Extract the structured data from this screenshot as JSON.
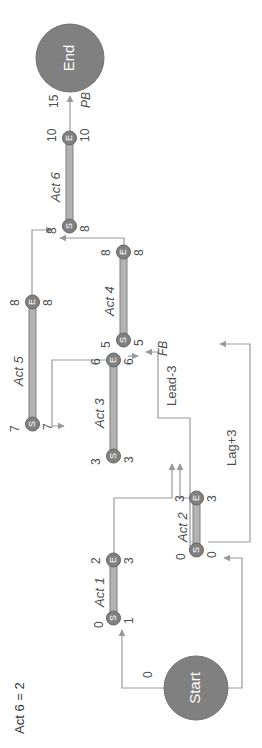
{
  "diagram": {
    "title_note": "Act 6 = 2",
    "rotation_deg": -90,
    "colors": {
      "node_fill": "#808080",
      "bar_fill": "#b3b3b3",
      "link": "#999999",
      "text": "#4d4d4d",
      "background": "#ffffff"
    },
    "terminals": {
      "start": {
        "label": "Start",
        "value": "0"
      },
      "end": {
        "label": "End",
        "value": "15"
      }
    },
    "activities": [
      {
        "id": "act1",
        "label": "Act 1",
        "start_marker": "S",
        "end_marker": "E",
        "start_top": "0",
        "start_bottom": "1",
        "end_top": "2",
        "end_bottom": "3"
      },
      {
        "id": "act2",
        "label": "Act 2",
        "start_marker": "S",
        "end_marker": "E",
        "start_top": "0",
        "start_bottom": "0",
        "end_top": "3",
        "end_bottom": "3"
      },
      {
        "id": "act3",
        "label": "Act 3",
        "start_marker": "S",
        "end_marker": "E",
        "start_top": "3",
        "start_bottom": "3",
        "end_top": "6",
        "end_bottom": "6"
      },
      {
        "id": "act4",
        "label": "Act 4",
        "start_marker": "S",
        "end_marker": "E",
        "start_top": "5",
        "start_bottom": "5",
        "end_top": "8",
        "end_bottom": "8"
      },
      {
        "id": "act5",
        "label": "Act 5",
        "start_marker": "S",
        "end_marker": "E",
        "start_top": "7",
        "start_bottom": "7",
        "end_top": "8",
        "end_bottom": "8"
      },
      {
        "id": "act6",
        "label": "Act 6",
        "start_marker": "S",
        "end_marker": "E",
        "start_top": "8",
        "start_bottom": "8",
        "end_top": "10",
        "end_bottom": "10"
      }
    ],
    "relations": [
      {
        "id": "lag3",
        "label": "Lag+3"
      },
      {
        "id": "lead3",
        "label": "Lead-3"
      },
      {
        "id": "fb",
        "label": "FB"
      },
      {
        "id": "pb",
        "label": "PB"
      }
    ]
  }
}
